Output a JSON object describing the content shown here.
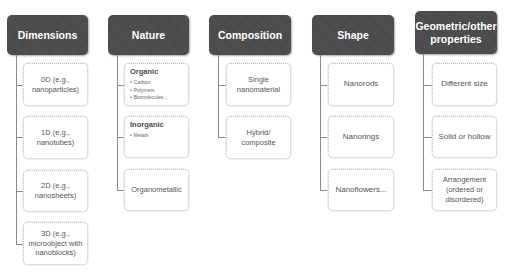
{
  "diagram": {
    "columns": [
      {
        "title": "Dimensions",
        "items": [
          {
            "text": "0D (e.g., nanoparticles)"
          },
          {
            "text": "1D (e.g., nanotubes)"
          },
          {
            "text": "2D (e.g., nanosheets)"
          },
          {
            "text": "3D (e.g., microobject with nanoblocks)"
          }
        ]
      },
      {
        "title": "Nature",
        "items": [
          {
            "title": "Organic",
            "bullets": [
              "Carbon",
              "Polymers",
              "Biomolecules..."
            ]
          },
          {
            "title": "Inorganic",
            "bullets": [
              "Metals"
            ]
          },
          {
            "text": "Organometallic"
          }
        ]
      },
      {
        "title": "Composition",
        "items": [
          {
            "text": "Single nanomaterial"
          },
          {
            "text": "Hybrid/ composite"
          }
        ]
      },
      {
        "title": "Shape",
        "items": [
          {
            "text": "Nanorods"
          },
          {
            "text": "Nanorings"
          },
          {
            "text": "Nanoflowers..."
          }
        ]
      },
      {
        "title": "Geometric/other properties",
        "items": [
          {
            "text": "Different size"
          },
          {
            "text": "Solid or hollow"
          },
          {
            "text": "Arrangement (ordered or disordered)"
          }
        ]
      }
    ],
    "colors": {
      "header_fill": "#4b4b4b",
      "header_text": "#ffffff",
      "connector": "#8a8a8a",
      "box_border": "#bdbdbd"
    }
  }
}
